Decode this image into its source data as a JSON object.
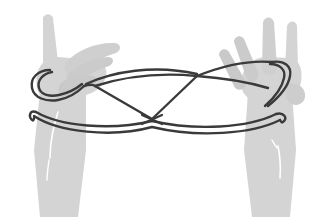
{
  "illustration": {
    "title": "Cat's Cradle string figure held between two hands",
    "subject": "string-figure",
    "canvas": {
      "width": 320,
      "height": 217,
      "background": "#ffffff"
    },
    "palette": {
      "background": "#ffffff",
      "hand_fill": "#d4d4d4",
      "hand_fill_shadow": "#c4c4c4",
      "hand_highlight": "#ffffff",
      "string_stroke": "#3a3a3a",
      "string_stroke_light": "#4a4a4a"
    },
    "hands": [
      {
        "name": "left-hand",
        "side": "left",
        "description": "Left hand seen from the side, index finger raised vertically, remaining fingers folded forward to the right, forearm descending to bottom-left",
        "fill": "#d4d4d4",
        "fingers": [
          {
            "name": "index-finger",
            "orientation": "vertical-up",
            "tip": [
              45,
              14
            ]
          },
          {
            "name": "middle-finger",
            "orientation": "folded-right",
            "tip": [
              118,
              47
            ]
          },
          {
            "name": "ring-finger",
            "orientation": "folded-right",
            "tip": [
              110,
              62
            ]
          },
          {
            "name": "thumb",
            "orientation": "tucked",
            "tip": [
              92,
              80
            ]
          }
        ],
        "wrist": {
          "top": [
            40,
            108
          ],
          "bottom": [
            62,
            200
          ]
        }
      },
      {
        "name": "right-hand",
        "side": "right",
        "description": "Right hand seen from the side, fingers splayed upward, forearm descending to bottom-right",
        "fill": "#d4d4d4",
        "fingers": [
          {
            "name": "index-finger",
            "orientation": "up",
            "tip": [
              292,
              22
            ]
          },
          {
            "name": "middle-finger",
            "orientation": "up",
            "tip": [
              267,
              18
            ]
          },
          {
            "name": "ring-finger",
            "orientation": "up-left",
            "tip": [
              238,
              38
            ]
          },
          {
            "name": "little-finger",
            "orientation": "up-left",
            "tip": [
              224,
              52
            ]
          },
          {
            "name": "thumb",
            "orientation": "lower-right",
            "tip": [
              299,
              96
            ]
          }
        ],
        "wrist": {
          "top": [
            252,
            104
          ],
          "bottom": [
            272,
            205
          ]
        }
      }
    ],
    "string": {
      "name": "loop-of-string",
      "color": "#3a3a3a",
      "width_px": 2.4,
      "crossings": [
        {
          "name": "center-crossing",
          "point": [
            152,
            119
          ],
          "type": "X"
        },
        {
          "name": "upper-right-node",
          "point": [
            197,
            76
          ],
          "type": "junction"
        },
        {
          "name": "upper-left-node",
          "point": [
            95,
            86
          ],
          "type": "junction"
        }
      ],
      "segments": [
        {
          "name": "left-index-loop",
          "description": "loop encircling the raised left index finger"
        },
        {
          "name": "right-finger-loop",
          "description": "loop encircling a raised right finger"
        },
        {
          "name": "upper-span",
          "description": "upper string spanning between the hands over the center"
        },
        {
          "name": "diagonal-left",
          "description": "diagonal from upper-left node down to center crossing"
        },
        {
          "name": "diagonal-right",
          "description": "diagonal from upper-right node down to center crossing"
        },
        {
          "name": "lower-span-front",
          "description": "long lower string from left wrist to right wrist, front strand"
        },
        {
          "name": "lower-span-back",
          "description": "long lower string from left wrist to right wrist, back strand"
        }
      ]
    }
  }
}
